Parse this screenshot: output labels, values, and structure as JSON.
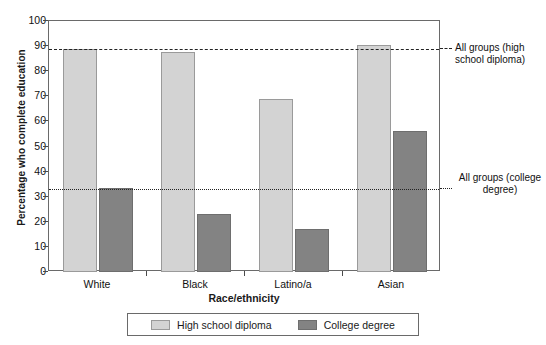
{
  "chart_data": {
    "type": "bar",
    "title": "",
    "xlabel": "Race/ethnicity",
    "ylabel": "Percentage who complete education",
    "categories": [
      "White",
      "Black",
      "Latino/a",
      "Asian"
    ],
    "series": [
      {
        "name": "High school diploma",
        "color": "#d3d3d3",
        "values": [
          89,
          87.5,
          69,
          90.5
        ]
      },
      {
        "name": "College degree",
        "color": "#838383",
        "values": [
          33.5,
          23,
          17,
          56
        ]
      }
    ],
    "ylim": [
      0,
      100
    ],
    "yticks": [
      "0",
      "10",
      "20",
      "30",
      "40",
      "50",
      "60",
      "70",
      "80",
      "90",
      "100"
    ],
    "grid": false,
    "legend_position": "bottom",
    "reference_lines": [
      {
        "value": 89,
        "style": "dashed",
        "label": "All groups (high school diploma)"
      },
      {
        "value": 33,
        "style": "dotted",
        "label": "All groups (college degree)"
      }
    ]
  },
  "annotations": {
    "high_school_line": "All groups (high school diploma)",
    "college_line": "All groups (college degree)"
  },
  "legend": {
    "items": [
      {
        "label": "High school diploma"
      },
      {
        "label": "College degree"
      }
    ]
  }
}
